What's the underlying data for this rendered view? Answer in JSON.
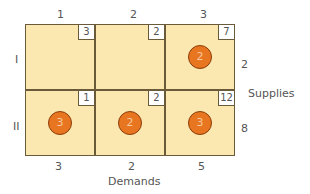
{
  "columns": [
    "1",
    "2",
    "3"
  ],
  "rows": [
    "I",
    "II"
  ],
  "costs": [
    [
      "3",
      "2",
      "7"
    ],
    [
      "1",
      "2",
      "12"
    ]
  ],
  "allocations": [
    [
      "",
      "",
      "2"
    ],
    [
      "3",
      "2",
      "3"
    ]
  ],
  "supplies": [
    "2",
    "8"
  ],
  "demands": [
    "3",
    "2",
    "5"
  ],
  "supplies_label": "Supplies",
  "demands_label": "Demands",
  "colors": {
    "cell_fill": "#fbe7b0",
    "circle_fill": "#e8751f",
    "border": "#6b5a3a"
  }
}
